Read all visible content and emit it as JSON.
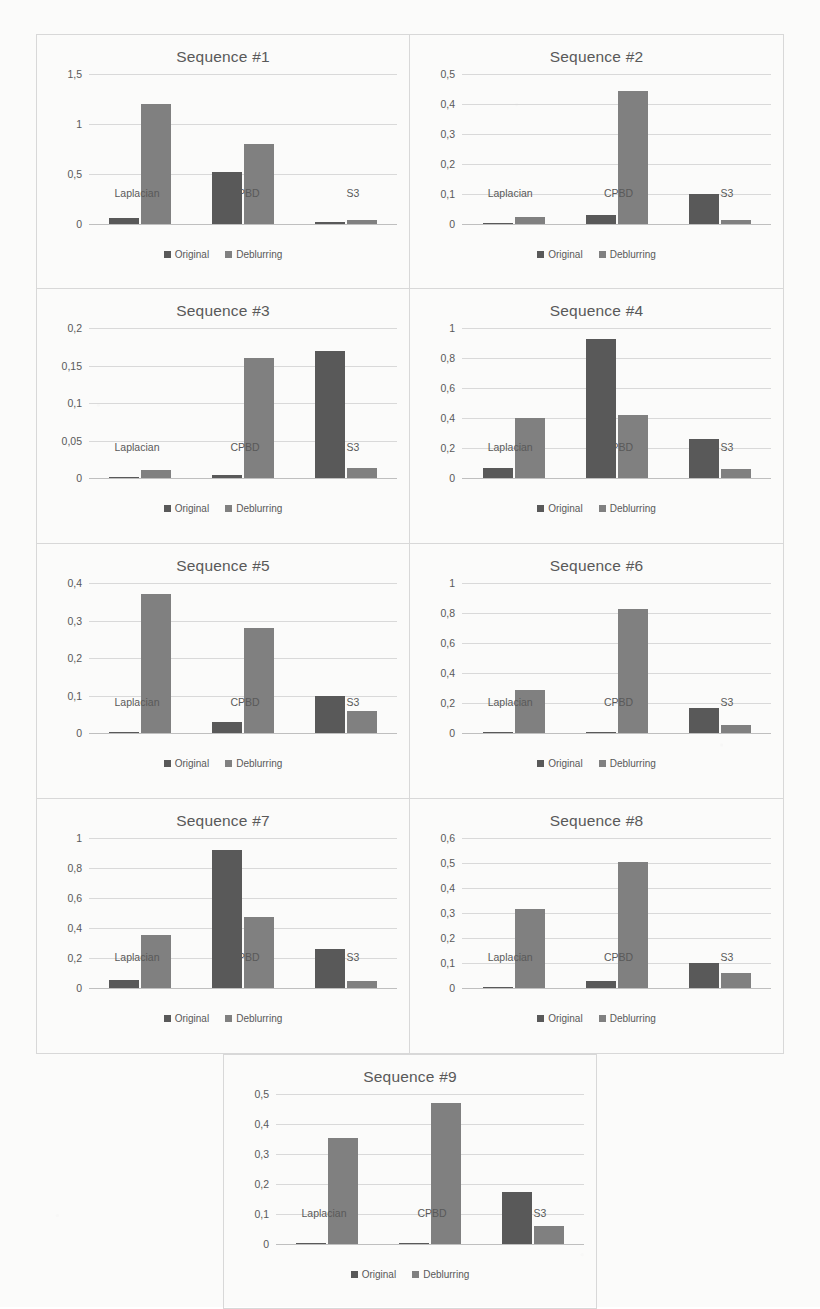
{
  "page": {
    "top_text_fragment": "",
    "colors": {
      "original": "#595959",
      "deblurring": "#808080",
      "gridline": "#d9d9d9",
      "panel_border": "#d8d8d8",
      "text": "#595959",
      "background": "#fbfbfa"
    }
  },
  "legend": {
    "original_label": "Original",
    "deblurring_label": "Deblurring"
  },
  "categories": [
    "Laplacian",
    "CPBD",
    "S3"
  ],
  "chart_data": [
    {
      "type": "bar",
      "title": "Sequence #1",
      "xlabel": "",
      "ylabel": "",
      "categories": [
        "Laplacian",
        "CPBD",
        "S3"
      ],
      "ylim": [
        0,
        1.5
      ],
      "yticks": [
        0,
        0.5,
        1,
        1.5
      ],
      "ytick_labels": [
        "0",
        "0,5",
        "1",
        "1,5"
      ],
      "grid": true,
      "legend_position": "bottom",
      "series": [
        {
          "name": "Original",
          "values": [
            0.06,
            0.52,
            0.02
          ]
        },
        {
          "name": "Deblurring",
          "values": [
            1.2,
            0.8,
            0.04
          ]
        }
      ]
    },
    {
      "type": "bar",
      "title": "Sequence #2",
      "xlabel": "",
      "ylabel": "",
      "categories": [
        "Laplacian",
        "CPBD",
        "S3"
      ],
      "ylim": [
        0,
        0.5
      ],
      "yticks": [
        0,
        0.1,
        0.2,
        0.3,
        0.4,
        0.5
      ],
      "ytick_labels": [
        "0",
        "0,1",
        "0,2",
        "0,3",
        "0,4",
        "0,5"
      ],
      "grid": true,
      "legend_position": "bottom",
      "series": [
        {
          "name": "Original",
          "values": [
            0.005,
            0.03,
            0.1
          ]
        },
        {
          "name": "Deblurring",
          "values": [
            0.025,
            0.445,
            0.015
          ]
        }
      ]
    },
    {
      "type": "bar",
      "title": "Sequence #3",
      "xlabel": "",
      "ylabel": "",
      "categories": [
        "Laplacian",
        "CPBD",
        "S3"
      ],
      "ylim": [
        0,
        0.2
      ],
      "yticks": [
        0,
        0.05,
        0.1,
        0.15,
        0.2
      ],
      "ytick_labels": [
        "0",
        "0,05",
        "0,1",
        "0,15",
        "0,2"
      ],
      "grid": true,
      "legend_position": "bottom",
      "series": [
        {
          "name": "Original",
          "values": [
            0.001,
            0.004,
            0.17
          ]
        },
        {
          "name": "Deblurring",
          "values": [
            0.011,
            0.16,
            0.013
          ]
        }
      ]
    },
    {
      "type": "bar",
      "title": "Sequence #4",
      "xlabel": "",
      "ylabel": "",
      "categories": [
        "Laplacian",
        "CPBD",
        "S3"
      ],
      "ylim": [
        0,
        1
      ],
      "yticks": [
        0,
        0.2,
        0.4,
        0.6,
        0.8,
        1
      ],
      "ytick_labels": [
        "0",
        "0,2",
        "0,4",
        "0,6",
        "0,8",
        "1"
      ],
      "grid": true,
      "legend_position": "bottom",
      "series": [
        {
          "name": "Original",
          "values": [
            0.07,
            0.93,
            0.26
          ]
        },
        {
          "name": "Deblurring",
          "values": [
            0.4,
            0.42,
            0.06
          ]
        }
      ]
    },
    {
      "type": "bar",
      "title": "Sequence #5",
      "xlabel": "",
      "ylabel": "",
      "categories": [
        "Laplacian",
        "CPBD",
        "S3"
      ],
      "ylim": [
        0,
        0.4
      ],
      "yticks": [
        0,
        0.1,
        0.2,
        0.3,
        0.4
      ],
      "ytick_labels": [
        "0",
        "0,1",
        "0,2",
        "0,3",
        "0,4"
      ],
      "grid": true,
      "legend_position": "bottom",
      "series": [
        {
          "name": "Original",
          "values": [
            0.002,
            0.03,
            0.1
          ]
        },
        {
          "name": "Deblurring",
          "values": [
            0.37,
            0.28,
            0.06
          ]
        }
      ]
    },
    {
      "type": "bar",
      "title": "Sequence #6",
      "xlabel": "",
      "ylabel": "",
      "categories": [
        "Laplacian",
        "CPBD",
        "S3"
      ],
      "ylim": [
        0,
        1
      ],
      "yticks": [
        0,
        0.2,
        0.4,
        0.6,
        0.8,
        1
      ],
      "ytick_labels": [
        "0",
        "0,2",
        "0,4",
        "0,6",
        "0,8",
        "1"
      ],
      "grid": true,
      "legend_position": "bottom",
      "series": [
        {
          "name": "Original",
          "values": [
            0.002,
            0.005,
            0.17
          ]
        },
        {
          "name": "Deblurring",
          "values": [
            0.29,
            0.83,
            0.055
          ]
        }
      ]
    },
    {
      "type": "bar",
      "title": "Sequence #7",
      "xlabel": "",
      "ylabel": "",
      "categories": [
        "Laplacian",
        "CPBD",
        "S3"
      ],
      "ylim": [
        0,
        1
      ],
      "yticks": [
        0,
        0.2,
        0.4,
        0.6,
        0.8,
        1
      ],
      "ytick_labels": [
        "0",
        "0,2",
        "0,4",
        "0,6",
        "0,8",
        "1"
      ],
      "grid": true,
      "legend_position": "bottom",
      "series": [
        {
          "name": "Original",
          "values": [
            0.055,
            0.92,
            0.26
          ]
        },
        {
          "name": "Deblurring",
          "values": [
            0.355,
            0.475,
            0.045
          ]
        }
      ]
    },
    {
      "type": "bar",
      "title": "Sequence #8",
      "xlabel": "",
      "ylabel": "",
      "categories": [
        "Laplacian",
        "CPBD",
        "S3"
      ],
      "ylim": [
        0,
        0.6
      ],
      "yticks": [
        0,
        0.1,
        0.2,
        0.3,
        0.4,
        0.5,
        0.6
      ],
      "ytick_labels": [
        "0",
        "0,1",
        "0,2",
        "0,3",
        "0,4",
        "0,5",
        "0,6"
      ],
      "grid": true,
      "legend_position": "bottom",
      "series": [
        {
          "name": "Original",
          "values": [
            0.002,
            0.03,
            0.1
          ]
        },
        {
          "name": "Deblurring",
          "values": [
            0.315,
            0.505,
            0.06
          ]
        }
      ]
    },
    {
      "type": "bar",
      "title": "Sequence #9",
      "xlabel": "",
      "ylabel": "",
      "categories": [
        "Laplacian",
        "CPBD",
        "S3"
      ],
      "ylim": [
        0,
        0.5
      ],
      "yticks": [
        0,
        0.1,
        0.2,
        0.3,
        0.4,
        0.5
      ],
      "ytick_labels": [
        "0",
        "0,1",
        "0,2",
        "0,3",
        "0,4",
        "0,5"
      ],
      "grid": true,
      "legend_position": "bottom",
      "series": [
        {
          "name": "Original",
          "values": [
            0.002,
            0.005,
            0.175
          ]
        },
        {
          "name": "Deblurring",
          "values": [
            0.355,
            0.47,
            0.06
          ]
        }
      ]
    }
  ]
}
